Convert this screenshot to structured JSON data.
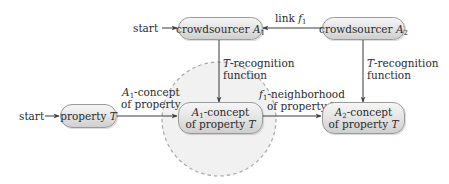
{
  "diagram": {
    "nodes": {
      "crowdsourcer_a1": {
        "prefix": "crowdsourcer ",
        "var": "A",
        "sub": "1"
      },
      "crowdsourcer_a2": {
        "prefix": "crowdsourcer ",
        "var": "A",
        "sub": "2"
      },
      "property_t": {
        "prefix": "property ",
        "var": "T"
      },
      "a1_concept": {
        "var": "A",
        "sub": "1",
        "line1_suffix": "-concept",
        "line2_prefix": "of property ",
        "line2_var": "T"
      },
      "a2_concept": {
        "var": "A",
        "sub": "2",
        "line1_suffix": "-concept",
        "line2_prefix": "of property ",
        "line2_var": "T"
      }
    },
    "start_labels": {
      "top": "start",
      "left": "start"
    },
    "edge_labels": {
      "link": {
        "prefix": "link ",
        "var": "f",
        "sub": "1"
      },
      "recognition_left": {
        "var": "T",
        "line1_suffix": "-recognition",
        "line2": "function"
      },
      "recognition_right": {
        "var": "T",
        "line1_suffix": "-recognition",
        "line2": "function"
      },
      "a1_concept_of_property": {
        "var": "A",
        "sub": "1",
        "line1_suffix": "-concept",
        "line2": "of property"
      },
      "f1_neighborhood": {
        "var": "f",
        "sub": "1",
        "line1_suffix": "-neighborhood",
        "line2_prefix": "of property ",
        "line2_var": "T"
      }
    },
    "colors": {
      "edge": "#3a3a3a",
      "node_border": "#9a9a9a",
      "node_fill_top": "#f6f6f6",
      "node_fill_bottom": "#cfcfcf",
      "neighborhood_fill": "#efefef",
      "neighborhood_stroke": "#a8a8a8"
    }
  }
}
